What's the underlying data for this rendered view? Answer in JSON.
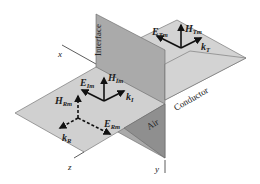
{
  "diagram": {
    "type": "3d-plane-wave-reflection-transmission",
    "regions": {
      "interface": "Interface",
      "conductor": "Conductor",
      "air": "Air"
    },
    "axes": {
      "x": "x",
      "y": "y",
      "z": "z"
    },
    "vectors": {
      "incident": {
        "E": {
          "main": "E",
          "sub": "Im"
        },
        "H": {
          "main": "H",
          "sub": "Im"
        },
        "k": {
          "main": "k",
          "sub": "I"
        }
      },
      "reflected": {
        "E": {
          "main": "E",
          "sub": "Rm"
        },
        "H": {
          "main": "H",
          "sub": "Rm"
        },
        "k": {
          "main": "k",
          "sub": "R"
        }
      },
      "transmitted": {
        "E": {
          "main": "E",
          "sub": "Tm"
        },
        "H": {
          "main": "H",
          "sub": "Tm"
        },
        "k": {
          "main": "k",
          "sub": "T"
        }
      }
    },
    "colors": {
      "plane_light": "#cfcfcf",
      "plane_interface": "#a9a9a9",
      "plane_air_dark": "#8e8e8e",
      "edge": "#555555",
      "arrow": "#111111"
    }
  }
}
